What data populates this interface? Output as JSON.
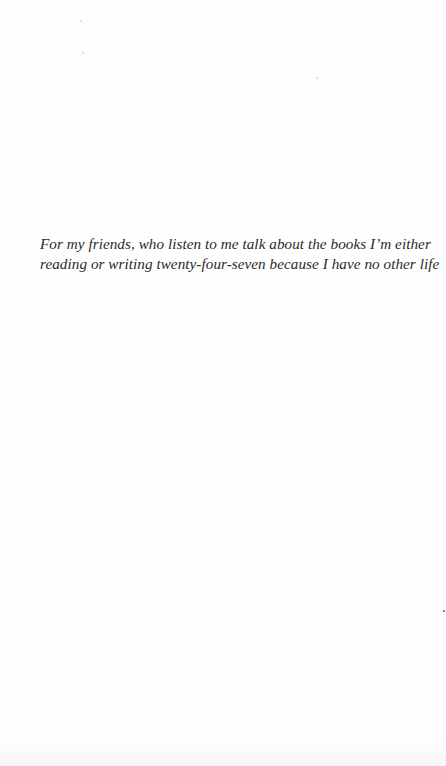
{
  "page": {
    "type": "book-dedication-page",
    "background_color": "#fefefe",
    "text_color": "#2a2a2a"
  },
  "dedication": {
    "lines": [
      "For my friends, who listen to me talk about the books I’m either",
      "reading or writing twenty-four-seven because I have no other life"
    ]
  }
}
